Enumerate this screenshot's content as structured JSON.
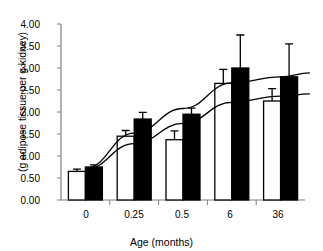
{
  "chart_data": {
    "type": "bar",
    "title": "",
    "xlabel": "Age (months)",
    "ylabel": "(g adipose tissue per g kidney)",
    "categories": [
      "0",
      "0.25",
      "0.5",
      "6",
      "36"
    ],
    "ylim": [
      0,
      4.0
    ],
    "ytick_step": 0.5,
    "ytick_labels": [
      "0.00",
      "0.50",
      "1.00",
      "1.50",
      "2.00",
      "2.50",
      "3.00",
      "3.50",
      "4.00"
    ],
    "ytick_values": [
      0,
      0.5,
      1.0,
      1.5,
      2.0,
      2.5,
      3.0,
      3.5,
      4.0
    ],
    "grid": false,
    "legend": "none",
    "series": [
      {
        "name": "white",
        "fill": "#ffffff",
        "stroke": "#000000",
        "values": [
          0.65,
          1.45,
          1.37,
          2.65,
          2.25
        ],
        "errors": [
          0.05,
          0.13,
          0.2,
          0.32,
          0.28
        ]
      },
      {
        "name": "black",
        "fill": "#000000",
        "stroke": "#000000",
        "values": [
          0.75,
          1.84,
          1.95,
          3.0,
          2.8
        ],
        "errors": [
          0.05,
          0.15,
          0.14,
          0.75,
          0.75
        ]
      }
    ],
    "trend_lines": [
      {
        "name": "upper-trend",
        "points": [
          [
            0.0,
            0.72
          ],
          [
            0.25,
            1.52
          ],
          [
            0.5,
            2.08
          ],
          [
            1.0,
            2.66
          ],
          [
            1.5,
            2.8
          ],
          [
            2.0,
            2.89
          ]
        ]
      },
      {
        "name": "lower-trend",
        "points": [
          [
            0.0,
            0.7
          ],
          [
            0.25,
            1.28
          ],
          [
            0.5,
            1.74
          ],
          [
            1.0,
            2.22
          ],
          [
            1.5,
            2.36
          ],
          [
            2.0,
            2.41
          ]
        ]
      }
    ]
  },
  "axis_color": "#808080",
  "plot_color": "#000000"
}
